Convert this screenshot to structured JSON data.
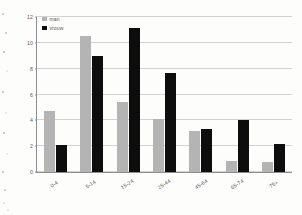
{
  "chart_data": {
    "type": "bar",
    "title": "",
    "subtitle": "",
    "xlabel": "",
    "ylabel": "",
    "ylim": [
      0,
      12
    ],
    "yticks": [
      0,
      2,
      4,
      6,
      8,
      10,
      12
    ],
    "ytick_labels": [
      "0",
      "2",
      "4",
      "6",
      "8",
      "10",
      "12"
    ],
    "grid": "horizontal",
    "legend_position": "top-left",
    "categories": [
      "0-4",
      "5-14",
      "15-24",
      "25-44",
      "45-64",
      "65-74",
      "75+"
    ],
    "series": [
      {
        "name": "man",
        "color": "#b4b4b4",
        "values": [
          4.7,
          10.5,
          5.4,
          4.1,
          3.2,
          0.85,
          0.75
        ]
      },
      {
        "name": "vrouw",
        "color": "#0d0d0d",
        "values": [
          2.1,
          9.0,
          11.15,
          7.7,
          3.3,
          4.0,
          2.15
        ]
      }
    ]
  }
}
